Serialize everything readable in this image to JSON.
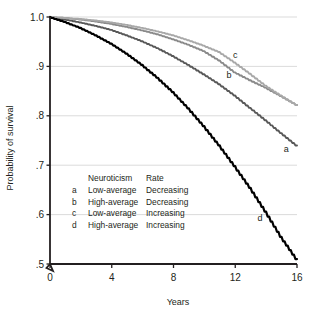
{
  "chart_data": {
    "type": "line",
    "title": "",
    "xlabel": "Years",
    "ylabel": "Probability of survival",
    "xlim": [
      0,
      16
    ],
    "ylim": [
      0.5,
      1.0
    ],
    "xticks": [
      0,
      4,
      8,
      12,
      16
    ],
    "xtick_labels": [
      "0",
      "4",
      "8",
      "12",
      "16"
    ],
    "yticks": [
      0.5,
      0.6,
      0.7,
      0.8,
      0.9,
      1.0
    ],
    "ytick_labels": [
      ".5",
      ".6",
      ".7",
      ".8",
      ".9",
      "1.0"
    ],
    "grid": "horizontal",
    "axis_break": true,
    "legend_position": "inside-lower-left",
    "series": [
      {
        "key": "a",
        "name": "Low-average Decreasing",
        "neuroticism": "Low-average",
        "rate": "Decreasing",
        "color": "#585858",
        "end_label": "a",
        "x": [
          0,
          1,
          2,
          3,
          4,
          5,
          6,
          7,
          8,
          9,
          10,
          11,
          12,
          13,
          14,
          15,
          16
        ],
        "values": [
          1.0,
          0.995,
          0.989,
          0.982,
          0.974,
          0.963,
          0.951,
          0.937,
          0.921,
          0.903,
          0.884,
          0.864,
          0.841,
          0.816,
          0.791,
          0.765,
          0.74
        ]
      },
      {
        "key": "b",
        "name": "High-average Decreasing",
        "neuroticism": "High-average",
        "rate": "Decreasing",
        "color": "#8a8a8a",
        "end_label": "b",
        "x": [
          0,
          1,
          2,
          3,
          4,
          5,
          6,
          7,
          8,
          9,
          10,
          11,
          12,
          13,
          14,
          15,
          16
        ],
        "values": [
          1.0,
          0.998,
          0.995,
          0.991,
          0.986,
          0.98,
          0.973,
          0.965,
          0.955,
          0.944,
          0.931,
          0.912,
          0.888,
          0.872,
          0.857,
          0.84,
          0.822
        ]
      },
      {
        "key": "c",
        "name": "Low-average Increasing",
        "neuroticism": "Low-average",
        "rate": "Increasing",
        "color": "#a8a8a8",
        "end_label": "c",
        "x": [
          0,
          1,
          2,
          3,
          4,
          5,
          6,
          7,
          8,
          9,
          10,
          11,
          12,
          13,
          14,
          15,
          16
        ],
        "values": [
          1.0,
          0.998,
          0.996,
          0.993,
          0.989,
          0.984,
          0.978,
          0.971,
          0.963,
          0.953,
          0.942,
          0.929,
          0.908,
          0.885,
          0.861,
          0.841,
          0.822
        ]
      },
      {
        "key": "d",
        "name": "High-average Increasing",
        "neuroticism": "High-average",
        "rate": "Increasing",
        "color": "#000000",
        "end_label": "d",
        "x": [
          0,
          1,
          2,
          3,
          4,
          5,
          6,
          7,
          8,
          9,
          10,
          11,
          12,
          13,
          14,
          15,
          16
        ],
        "values": [
          1.0,
          0.99,
          0.978,
          0.963,
          0.946,
          0.926,
          0.903,
          0.877,
          0.848,
          0.815,
          0.779,
          0.74,
          0.698,
          0.654,
          0.606,
          0.555,
          0.51
        ]
      }
    ],
    "curve_labels": [
      {
        "text": "a",
        "x": 15.3,
        "y": 0.727
      },
      {
        "text": "b",
        "x": 11.6,
        "y": 0.877
      },
      {
        "text": "c",
        "x": 12.0,
        "y": 0.918
      },
      {
        "text": "d",
        "x": 13.6,
        "y": 0.588
      }
    ],
    "legend": {
      "headers": [
        "",
        "Neuroticism",
        "Rate"
      ],
      "rows": [
        {
          "key": "a",
          "neuroticism": "Low-average",
          "rate": "Decreasing"
        },
        {
          "key": "b",
          "neuroticism": "High-average",
          "rate": "Decreasing"
        },
        {
          "key": "c",
          "neuroticism": "Low-average",
          "rate": "Increasing"
        },
        {
          "key": "d",
          "neuroticism": "High-average",
          "rate": "Increasing"
        }
      ]
    },
    "colors": {
      "axis": "#231f20",
      "grid": "#d7d7d7",
      "text": "#231f20",
      "background": "#ffffff"
    }
  }
}
